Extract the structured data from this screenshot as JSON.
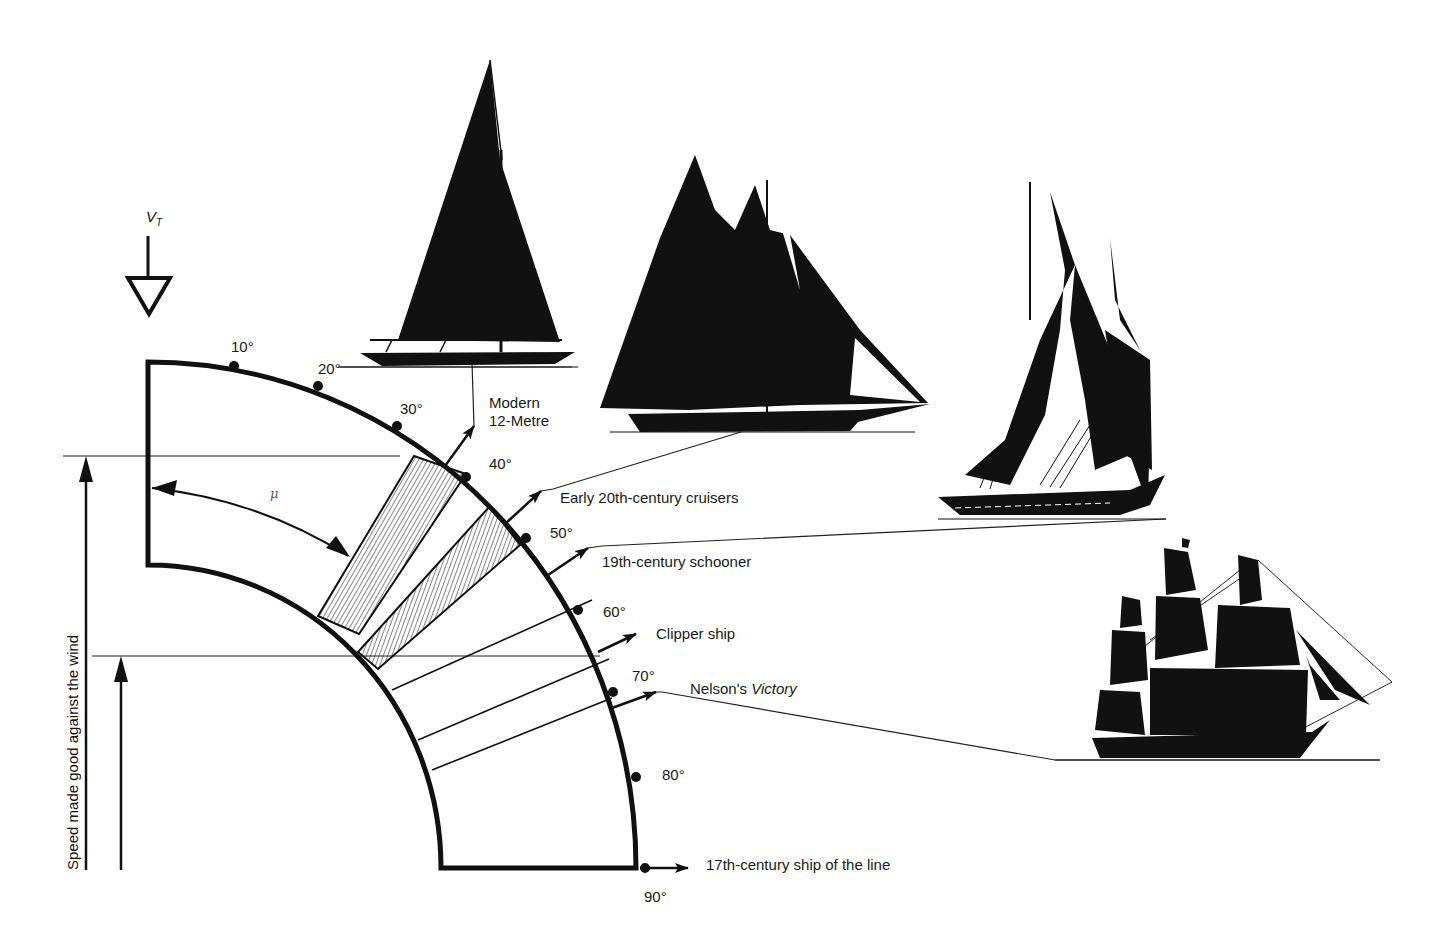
{
  "diagram": {
    "wind_label": "V",
    "wind_label_sub": "T",
    "angle_symbol": "μ",
    "y_axis_label": "Speed made good against the wind",
    "colors": {
      "ink": "#111111",
      "paper": "#ffffff"
    },
    "degree_marks": [
      {
        "label": "10°",
        "angle": 10
      },
      {
        "label": "20°",
        "angle": 20
      },
      {
        "label": "30°",
        "angle": 30
      },
      {
        "label": "40°",
        "angle": 40
      },
      {
        "label": "50°",
        "angle": 50
      },
      {
        "label": "60°",
        "angle": 60
      },
      {
        "label": "70°",
        "angle": 70
      },
      {
        "label": "80°",
        "angle": 80
      },
      {
        "label": "90°",
        "angle": 90
      }
    ],
    "vessels": [
      {
        "name": "Modern 12-Metre",
        "line1": "Modern",
        "line2": "12-Metre",
        "course_angle": 33
      },
      {
        "name": "Early 20th-century cruisers",
        "course_angle": 42
      },
      {
        "name": "19th-century schooner",
        "course_angle": 52
      },
      {
        "name": "Clipper ship",
        "course_angle": 64
      },
      {
        "name_prefix": "Nelson's ",
        "name_italic": "Victory",
        "course_angle": 72
      },
      {
        "name": "17th-century ship of the line",
        "course_angle": 90
      }
    ]
  }
}
